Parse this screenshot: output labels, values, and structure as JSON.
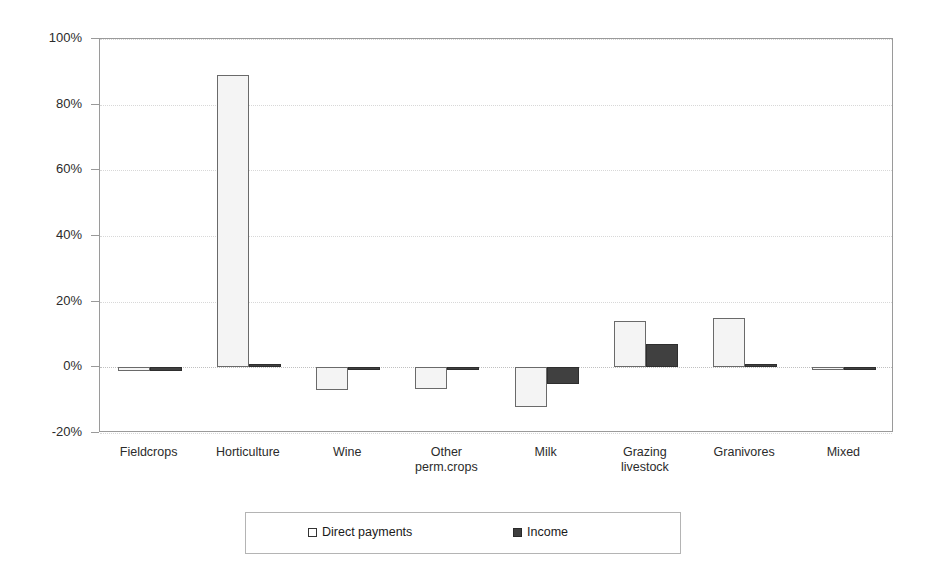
{
  "chart_data": {
    "type": "bar",
    "title": "",
    "subtitle": "",
    "xlabel": "",
    "ylabel": "",
    "ylim": [
      -20,
      100
    ],
    "grid": true,
    "legend_position": "bottom",
    "categories": [
      "Fieldcrops",
      "Horticulture",
      "Wine",
      "Other\nperm.crops",
      "Milk",
      "Grazing\nlivestock",
      "Granivores",
      "Mixed"
    ],
    "y_ticks": [
      {
        "value": 100,
        "label": "100%"
      },
      {
        "value": 80,
        "label": "80%"
      },
      {
        "value": 60,
        "label": "60%"
      },
      {
        "value": 40,
        "label": "40%"
      },
      {
        "value": 20,
        "label": "20%"
      },
      {
        "value": 0,
        "label": "0%"
      },
      {
        "value": -20,
        "label": "-20%"
      }
    ],
    "series": [
      {
        "name": "Direct payments",
        "color": "#f4f4f4",
        "border_color": "#6a6a6a",
        "values": [
          -1.2,
          89,
          -7,
          -6.5,
          -12,
          14,
          15,
          -0.4
        ]
      },
      {
        "name": "Income",
        "color": "#404040",
        "border_color": "#2e2e2e",
        "values": [
          -1,
          0.3,
          -0.6,
          -0.6,
          -5,
          7,
          1,
          -0.3
        ]
      }
    ]
  },
  "legend": {
    "items": [
      {
        "label": "Direct payments",
        "swatch": "light-square-swatch"
      },
      {
        "label": "Income",
        "swatch": "dark-square-swatch"
      }
    ]
  }
}
